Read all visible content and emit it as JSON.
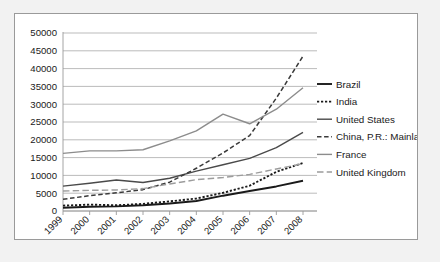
{
  "chart_data": {
    "type": "line",
    "title": "",
    "xlabel": "",
    "ylabel": "",
    "categories": [
      "1999",
      "2000",
      "2001",
      "2002",
      "2003",
      "2004",
      "2005",
      "2006",
      "2007",
      "2008"
    ],
    "ylim": [
      0,
      50000
    ],
    "ytick_labels": [
      "50000",
      "45000",
      "40000",
      "35000",
      "30000",
      "25000",
      "20000",
      "15000",
      "10000",
      "5000",
      "0"
    ],
    "ytick_values": [
      50000,
      45000,
      40000,
      35000,
      30000,
      25000,
      20000,
      15000,
      10000,
      5000,
      0
    ],
    "grid": true,
    "legend_position": "right",
    "series": [
      {
        "name": "Brazil",
        "style": "solid",
        "color": "#1a1a1a",
        "width": 1.9,
        "values": [
          900,
          1200,
          1300,
          1600,
          2100,
          2800,
          4300,
          5600,
          6900,
          8500
        ]
      },
      {
        "name": "India",
        "style": "dotted",
        "color": "#1a1a1a",
        "width": 1.9,
        "values": [
          1500,
          1800,
          1600,
          2000,
          2700,
          3500,
          5100,
          7100,
          11000,
          13500
        ]
      },
      {
        "name": "United States",
        "style": "solid",
        "color": "#4a4a4a",
        "width": 1.4,
        "values": [
          7000,
          7800,
          8700,
          8000,
          9200,
          11200,
          13000,
          14800,
          17800,
          22100
        ]
      },
      {
        "name": "China, P.R.: Mainland",
        "style": "dashed",
        "color": "#3a3a3a",
        "width": 1.5,
        "values": [
          3300,
          4300,
          5100,
          6000,
          8100,
          12000,
          16300,
          21200,
          31700,
          43500
        ]
      },
      {
        "name": "France",
        "style": "solid",
        "color": "#8c8c8c",
        "width": 1.4,
        "values": [
          16200,
          16900,
          16900,
          17200,
          19700,
          22500,
          27200,
          24500,
          28600,
          34600
        ]
      },
      {
        "name": "United Kingdom",
        "style": "longdash",
        "color": "#9c9c9c",
        "width": 1.4,
        "values": [
          5600,
          5800,
          5900,
          6300,
          7600,
          8800,
          9400,
          10300,
          11800,
          13300
        ]
      }
    ]
  },
  "legend": {
    "items": [
      {
        "label": "Brazil"
      },
      {
        "label": "India"
      },
      {
        "label": "United States"
      },
      {
        "label": "China, P.R.: Mainland"
      },
      {
        "label": "France"
      },
      {
        "label": "United Kingdom"
      }
    ]
  }
}
